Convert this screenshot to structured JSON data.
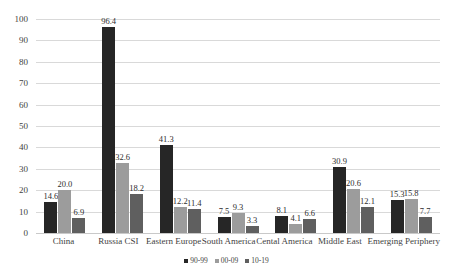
{
  "chart_data": {
    "type": "bar",
    "title": "",
    "subtitle": "",
    "xlabel": "",
    "ylabel": "",
    "ylim": [
      0,
      100
    ],
    "ytick_step": 10,
    "yticks": [
      "0",
      "10",
      "20",
      "30",
      "40",
      "50",
      "60",
      "70",
      "80",
      "90",
      "100"
    ],
    "grid": true,
    "legend_position": "bottom",
    "categories": [
      "China",
      "Russia CSI",
      "Eastern Europe",
      "South America",
      "Cental America",
      "Middle East",
      "Emerging Periphery"
    ],
    "series": [
      {
        "name": "90-99",
        "color": "#262626",
        "values": [
          14.6,
          96.4,
          41.3,
          7.5,
          8.1,
          30.9,
          15.3
        ],
        "labels": [
          "14.6",
          "96.4",
          "41.3",
          "7.5",
          "8.1",
          "30.9",
          "15.3"
        ]
      },
      {
        "name": "00-09",
        "color": "#9c9c9c",
        "values": [
          20.0,
          32.6,
          12.2,
          9.3,
          4.1,
          20.6,
          15.8
        ],
        "labels": [
          "20.0",
          "32.6",
          "12.2",
          "9.3",
          "4.1",
          "20.6",
          "15.8"
        ]
      },
      {
        "name": "10-19",
        "color": "#5f5f5f",
        "values": [
          6.9,
          18.2,
          11.4,
          3.3,
          6.6,
          12.1,
          7.7
        ],
        "labels": [
          "6.9",
          "18.2",
          "11.4",
          "3.3",
          "6.6",
          "12.1",
          "7.7"
        ]
      }
    ]
  },
  "colors": {
    "series_1": "#262626",
    "series_2": "#9c9c9c",
    "series_3": "#5f5f5f",
    "gridline": "#d9d9d9",
    "background": "#ffffff",
    "text": "#3f3f3f"
  }
}
